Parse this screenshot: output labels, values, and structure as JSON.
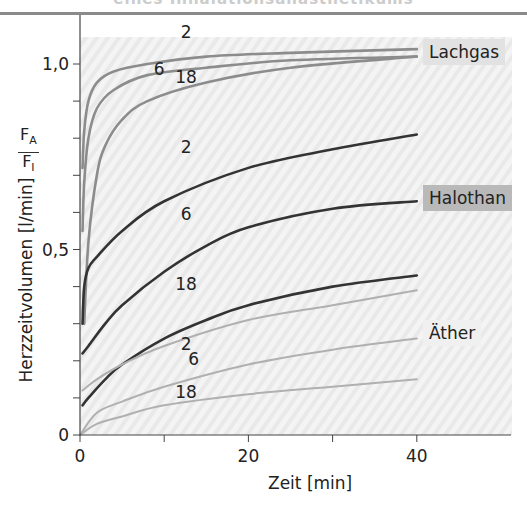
{
  "header": {
    "caption": "eines Inhalationsanästhetikums"
  },
  "chart_data": {
    "type": "line",
    "title": "",
    "xlabel": "Zeit [min]",
    "ylabel": "Herzzeitvolumen [l/min]",
    "ylabel_ratio": {
      "numerator": "F",
      "numerator_sub": "A",
      "denominator": "F",
      "denominator_sub": "I"
    },
    "xlim": [
      0,
      52
    ],
    "ylim": [
      0,
      1.1
    ],
    "x_ticks": [
      0,
      10,
      20,
      30,
      40
    ],
    "x_tick_labels": [
      "0",
      "",
      "20",
      "",
      "40"
    ],
    "y_ticks": [
      0,
      0.1,
      0.2,
      0.3,
      0.4,
      0.5,
      0.6,
      0.7,
      0.8,
      0.9,
      1.0
    ],
    "y_tick_labels": {
      "0": "0",
      "0.5": "0,5",
      "1.0": "1,0"
    },
    "grid": false,
    "groups": [
      {
        "name": "Lachgas",
        "color": "#8c8c8c",
        "label_bg": "#e2e2e2",
        "series": [
          {
            "name": "2",
            "x": [
              0.3,
              0.5,
              1,
              2,
              4,
              8,
              15,
              25,
              40
            ],
            "values": [
              0.72,
              0.82,
              0.9,
              0.95,
              0.98,
              1.0,
              1.02,
              1.03,
              1.04
            ]
          },
          {
            "name": "6",
            "x": [
              0.3,
              0.5,
              1,
              2,
              4,
              8,
              15,
              25,
              40
            ],
            "values": [
              0.55,
              0.68,
              0.8,
              0.88,
              0.93,
              0.97,
              0.99,
              1.01,
              1.02
            ]
          },
          {
            "name": "18",
            "x": [
              0.5,
              1,
              2,
              3,
              5,
              8,
              15,
              25,
              40
            ],
            "values": [
              0.3,
              0.52,
              0.7,
              0.78,
              0.85,
              0.9,
              0.95,
              0.99,
              1.02
            ]
          }
        ]
      },
      {
        "name": "Halothan",
        "color": "#333333",
        "label_bg": "#b9b9b9",
        "series": [
          {
            "name": "2",
            "x": [
              0.3,
              0.5,
              1,
              2,
              5,
              10,
              20,
              30,
              40
            ],
            "values": [
              0.3,
              0.4,
              0.45,
              0.48,
              0.55,
              0.63,
              0.72,
              0.77,
              0.81
            ]
          },
          {
            "name": "6",
            "x": [
              0.3,
              1,
              3,
              5,
              10,
              15,
              20,
              30,
              40
            ],
            "values": [
              0.22,
              0.24,
              0.3,
              0.35,
              0.44,
              0.51,
              0.56,
              0.61,
              0.63
            ]
          },
          {
            "name": "18",
            "x": [
              0.3,
              1,
              3,
              5,
              10,
              15,
              20,
              30,
              40
            ],
            "values": [
              0.08,
              0.1,
              0.15,
              0.19,
              0.26,
              0.31,
              0.35,
              0.4,
              0.43
            ]
          }
        ]
      },
      {
        "name": "Äther",
        "color": "#b0b0b0",
        "label_bg": "#f0f0f0",
        "series": [
          {
            "name": "2",
            "x": [
              0.3,
              2,
              5,
              10,
              20,
              30,
              40
            ],
            "values": [
              0.12,
              0.15,
              0.19,
              0.24,
              0.31,
              0.35,
              0.39
            ]
          },
          {
            "name": "6",
            "x": [
              0,
              2,
              5,
              10,
              20,
              30,
              40
            ],
            "values": [
              0.0,
              0.06,
              0.09,
              0.13,
              0.19,
              0.23,
              0.26
            ]
          },
          {
            "name": "18",
            "x": [
              0,
              2,
              5,
              10,
              20,
              30,
              40
            ],
            "values": [
              0.0,
              0.03,
              0.05,
              0.08,
              0.11,
              0.13,
              0.15
            ]
          }
        ]
      }
    ],
    "annotations": [
      {
        "text": "2",
        "x": 12.6,
        "y": 1.07
      },
      {
        "text": "6",
        "x": 9.4,
        "y": 0.97
      },
      {
        "text": "18",
        "x": 12.6,
        "y": 0.95
      },
      {
        "text": "2",
        "x": 12.6,
        "y": 0.76
      },
      {
        "text": "6",
        "x": 12.6,
        "y": 0.58
      },
      {
        "text": "18",
        "x": 12.6,
        "y": 0.39
      },
      {
        "text": "2",
        "x": 12.6,
        "y": 0.23
      },
      {
        "text": "6",
        "x": 13.5,
        "y": 0.19
      },
      {
        "text": "18",
        "x": 12.6,
        "y": 0.1
      }
    ]
  }
}
